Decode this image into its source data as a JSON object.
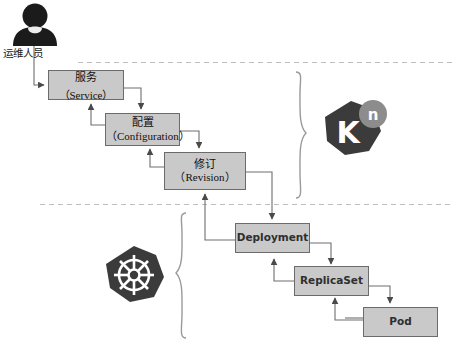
{
  "diagram": {
    "colors": {
      "node_fill": "#c9c9c9",
      "node_stroke": "#6b6b6b",
      "logo_dark": "#3b3b3b",
      "logo_accent": "#8c8c8c",
      "divider": "#b9b9b9",
      "wire": "#6e6e6e"
    }
  },
  "actor": {
    "icon": "person-icon",
    "label": "运维人员"
  },
  "knative_layer": {
    "brace": "right-curly-brace",
    "logo": {
      "icon": "knative-logo-icon",
      "mark": "K",
      "superscript": "n"
    },
    "nodes": [
      {
        "id": "service",
        "cn": "服务",
        "en": "（Service）"
      },
      {
        "id": "configuration",
        "cn": "配置",
        "en": "（Configuration）"
      },
      {
        "id": "revision",
        "cn": "修订",
        "en": "（Revision）"
      }
    ]
  },
  "kubernetes_layer": {
    "brace": "left-curly-brace",
    "logo": {
      "icon": "kubernetes-logo-icon",
      "mark": "helm-wheel"
    },
    "nodes": [
      {
        "id": "deployment",
        "label": "Deployment"
      },
      {
        "id": "replicaset",
        "label": "ReplicaSet"
      },
      {
        "id": "pod",
        "label": "Pod"
      }
    ]
  },
  "dividers": [
    {
      "id": "divider-top",
      "style": "dashed"
    },
    {
      "id": "divider-bottom",
      "style": "dashed"
    }
  ]
}
